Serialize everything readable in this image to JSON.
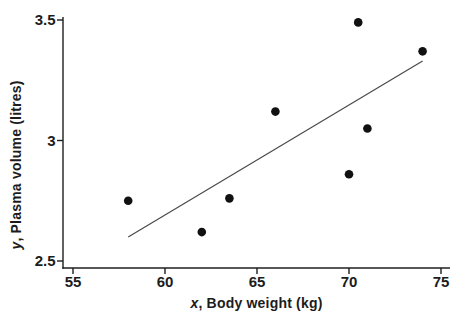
{
  "figure": {
    "background": "#ffffff"
  },
  "chart_data": {
    "type": "scatter",
    "title": "",
    "xlabel": "x, Body weight (kg)",
    "xlabel_var": "x",
    "xlabel_rest": ", Body weight (kg)",
    "ylabel": "y, Plasma volume (litres)",
    "ylabel_var": "y",
    "ylabel_rest": ", Plasma volume (litres)",
    "xlim": [
      55,
      75
    ],
    "ylim": [
      2.5,
      3.5
    ],
    "x_ticks": [
      {
        "v": 55,
        "label": "55"
      },
      {
        "v": 60,
        "label": "60"
      },
      {
        "v": 65,
        "label": "65"
      },
      {
        "v": 70,
        "label": "70"
      },
      {
        "v": 75,
        "label": "75"
      }
    ],
    "y_ticks": [
      {
        "v": 2.5,
        "label": "2.5"
      },
      {
        "v": 3,
        "label": "3"
      },
      {
        "v": 3.5,
        "label": "3.5"
      }
    ],
    "points": [
      {
        "x": 58.0,
        "y": 2.75
      },
      {
        "x": 62.0,
        "y": 2.62
      },
      {
        "x": 63.5,
        "y": 2.76
      },
      {
        "x": 66.0,
        "y": 3.12
      },
      {
        "x": 70.0,
        "y": 2.86
      },
      {
        "x": 70.5,
        "y": 3.49
      },
      {
        "x": 71.0,
        "y": 3.05
      },
      {
        "x": 74.0,
        "y": 3.37
      }
    ],
    "fit_line": {
      "x1": 58.0,
      "y1": 2.6,
      "x2": 74.0,
      "y2": 3.33
    },
    "grid": false,
    "legend": null,
    "colors": {
      "point": "#111111",
      "line": "#4a4a4a",
      "axis": "#1f1f1f",
      "text": "#1c1c1c",
      "background": "#ffffff"
    }
  }
}
